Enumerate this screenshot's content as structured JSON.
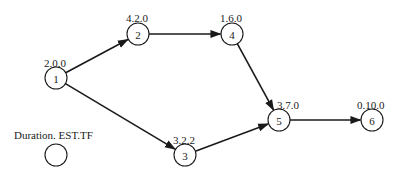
{
  "diagram": {
    "type": "activity-on-node network",
    "legend": {
      "label": "Duration. EST.TF",
      "x": 14,
      "y": 139,
      "cx": 56,
      "cy": 155
    },
    "nodes": [
      {
        "id": "1",
        "label": "1",
        "annotation": "2.0.0",
        "cx": 56,
        "cy": 78,
        "lx": 44,
        "ly": 67
      },
      {
        "id": "2",
        "label": "2",
        "annotation": "4.2.0",
        "cx": 138,
        "cy": 34,
        "lx": 126,
        "ly": 22
      },
      {
        "id": "3",
        "label": "3",
        "annotation": "3.2.2",
        "cx": 185,
        "cy": 155,
        "lx": 173,
        "ly": 144
      },
      {
        "id": "4",
        "label": "4",
        "annotation": "1.6.0",
        "cx": 232,
        "cy": 34,
        "lx": 220,
        "ly": 22
      },
      {
        "id": "5",
        "label": "5",
        "annotation": "3.7.0",
        "cx": 279,
        "cy": 120,
        "lx": 277,
        "ly": 109
      },
      {
        "id": "6",
        "label": "6",
        "annotation": "0.10.0",
        "cx": 372,
        "cy": 120,
        "lx": 357,
        "ly": 109
      }
    ],
    "edges": [
      {
        "from": "1",
        "to": "2"
      },
      {
        "from": "1",
        "to": "3"
      },
      {
        "from": "2",
        "to": "4"
      },
      {
        "from": "4",
        "to": "5"
      },
      {
        "from": "3",
        "to": "5"
      },
      {
        "from": "5",
        "to": "6"
      }
    ],
    "node_radius": 11,
    "colors": {
      "stroke": "#1a1a1a",
      "background": "#ffffff"
    }
  }
}
